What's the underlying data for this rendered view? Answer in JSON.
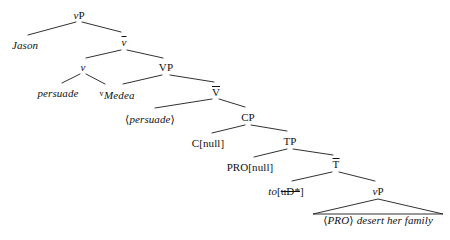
{
  "diagram": {
    "kind": "syntax-tree",
    "width": 450,
    "height": 240,
    "background_color": "#ffffff",
    "line_color": "#1a1a1a",
    "text_color": "#111111"
  },
  "nodes": {
    "vp_root": {
      "text": "vP",
      "x": 79,
      "y": 10
    },
    "jason": {
      "text": "Jason",
      "x": 25,
      "y": 40
    },
    "vbar": {
      "text": "v",
      "x": 124,
      "y": 36
    },
    "v_head": {
      "text": "v",
      "x": 83,
      "y": 62
    },
    "vp_big": {
      "text": "VP",
      "x": 166,
      "y": 62
    },
    "persuade_v": {
      "text": "persuade",
      "x": 58,
      "y": 88
    },
    "sup_v": {
      "text": "v",
      "x": 97,
      "y": 88
    },
    "medea": {
      "text": "Medea",
      "x": 119,
      "y": 90
    },
    "vbar_small": {
      "text": "V",
      "x": 216,
      "y": 86
    },
    "persuade_trace": {
      "text": "persuade",
      "x": 150,
      "y": 114
    },
    "cp": {
      "text": "CP",
      "x": 248,
      "y": 112
    },
    "c_null": {
      "text": "C[null]",
      "x": 208,
      "y": 138
    },
    "tp": {
      "text": "TP",
      "x": 290,
      "y": 136
    },
    "pro_null": {
      "text": "PRO[null]",
      "x": 250,
      "y": 162
    },
    "tbar": {
      "text": "T",
      "x": 336,
      "y": 158
    },
    "to_feature": {
      "text": "to",
      "x": 286,
      "y": 186
    },
    "to_bracket": {
      "text": "uD*",
      "x": 0,
      "y": 0
    },
    "vp_lower": {
      "text": "vP",
      "x": 378,
      "y": 186
    },
    "vp_span": {
      "text": "desert her family",
      "x": 0,
      "y": 0
    },
    "pro_trace": {
      "text": "PRO",
      "x": 0,
      "y": 0
    },
    "bottom_line": {
      "x": 378,
      "y": 215
    }
  },
  "labels": {
    "vp_root_italic": "v",
    "vp_root_roman": "P",
    "vp_lower_italic": "v",
    "vp_lower_roman": "P",
    "to_open_bracket": "[",
    "to_close_bracket": "]",
    "angle_open": "⟨",
    "angle_close": "⟩"
  },
  "edges": [
    {
      "name": "vp-to-jason",
      "x1": 76,
      "y1": 22,
      "x2": 28,
      "y2": 35
    },
    {
      "name": "vp-to-vbar",
      "x1": 82,
      "y1": 22,
      "x2": 121,
      "y2": 32
    },
    {
      "name": "vbar-to-v",
      "x1": 121,
      "y1": 50,
      "x2": 86,
      "y2": 58
    },
    {
      "name": "vbar-to-vp",
      "x1": 127,
      "y1": 50,
      "x2": 163,
      "y2": 58
    },
    {
      "name": "v-to-persuade",
      "x1": 80,
      "y1": 74,
      "x2": 62,
      "y2": 83
    },
    {
      "name": "v-to-medea",
      "x1": 86,
      "y1": 74,
      "x2": 105,
      "y2": 84
    },
    {
      "name": "vp-to-medea",
      "x1": 162,
      "y1": 75,
      "x2": 123,
      "y2": 84
    },
    {
      "name": "vp-to-vbar-small",
      "x1": 170,
      "y1": 75,
      "x2": 214,
      "y2": 82
    },
    {
      "name": "vbarsmall-to-trace",
      "x1": 212,
      "y1": 99,
      "x2": 155,
      "y2": 108
    },
    {
      "name": "vbarsmall-to-cp",
      "x1": 219,
      "y1": 99,
      "x2": 245,
      "y2": 107
    },
    {
      "name": "cp-to-cnull",
      "x1": 245,
      "y1": 125,
      "x2": 212,
      "y2": 133
    },
    {
      "name": "cp-to-tp",
      "x1": 251,
      "y1": 125,
      "x2": 287,
      "y2": 131
    },
    {
      "name": "tp-to-pronull",
      "x1": 287,
      "y1": 149,
      "x2": 254,
      "y2": 157
    },
    {
      "name": "tp-to-tbar",
      "x1": 293,
      "y1": 149,
      "x2": 333,
      "y2": 155
    },
    {
      "name": "tbar-to-to",
      "x1": 332,
      "y1": 172,
      "x2": 292,
      "y2": 181
    },
    {
      "name": "tbar-to-vplower",
      "x1": 339,
      "y1": 172,
      "x2": 375,
      "y2": 181
    }
  ],
  "triangle": {
    "name": "vp-constituent-triangle",
    "apex_x": 378,
    "apex_y": 199,
    "left_x": 313,
    "left_y": 214,
    "right_x": 443,
    "right_y": 214
  }
}
